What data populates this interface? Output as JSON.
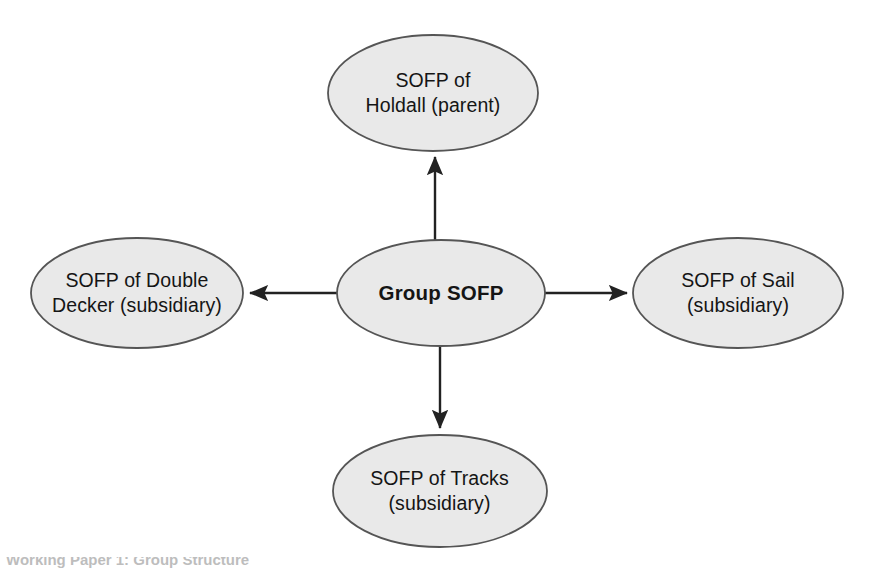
{
  "diagram": {
    "type": "hub-and-spoke",
    "background_color": "#ffffff",
    "node_fill": "#e9e9e9",
    "node_stroke": "#555555",
    "arrow_color": "#222222",
    "nodes": [
      {
        "id": "center",
        "label": "Group SOFP",
        "role": "group",
        "emphasis": "bold",
        "cx": 441,
        "cy": 293,
        "rx": 104,
        "ry": 53
      },
      {
        "id": "top",
        "label": "SOFP of\nHoldall (parent)",
        "role": "parent",
        "emphasis": "normal",
        "cx": 433,
        "cy": 93,
        "rx": 105,
        "ry": 58
      },
      {
        "id": "left",
        "label": "SOFP of Double\nDecker (subsidiary)",
        "role": "subsidiary",
        "emphasis": "normal",
        "cx": 137,
        "cy": 293,
        "rx": 106,
        "ry": 55
      },
      {
        "id": "right",
        "label": "SOFP of Sail\n(subsidiary)",
        "role": "subsidiary",
        "emphasis": "normal",
        "cx": 738,
        "cy": 293,
        "rx": 105,
        "ry": 55
      },
      {
        "id": "bottom",
        "label": "SOFP of Tracks\n(subsidiary)",
        "role": "subsidiary",
        "emphasis": "normal",
        "cx": 440,
        "cy": 491,
        "rx": 107,
        "ry": 56
      }
    ],
    "edges": [
      {
        "id": "center-to-top",
        "from": "center",
        "to": "top",
        "direction": "up"
      },
      {
        "id": "center-to-left",
        "from": "center",
        "to": "left",
        "direction": "left"
      },
      {
        "id": "center-to-right",
        "from": "center",
        "to": "right",
        "direction": "right"
      },
      {
        "id": "center-to-bottom",
        "from": "center",
        "to": "bottom",
        "direction": "down"
      }
    ]
  },
  "caption": {
    "text": "Working Paper 1: Group Structure"
  }
}
